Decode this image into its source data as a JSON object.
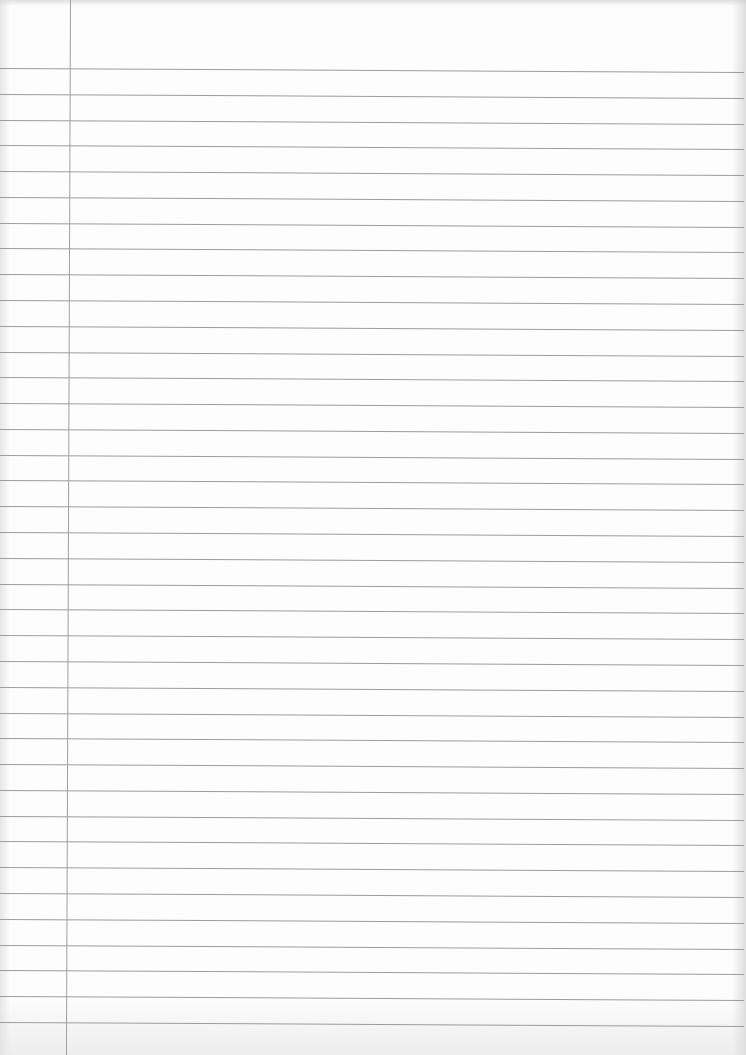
{
  "page": {
    "type": "lined-paper",
    "content_text": "",
    "background_color": "#fdfdfd",
    "rule_color": "#9c9c9c",
    "margin_color": "#a0a0a0",
    "rule_count": 38,
    "first_rule_y": 68,
    "rule_spacing": 25.78,
    "margin_x": 70
  }
}
